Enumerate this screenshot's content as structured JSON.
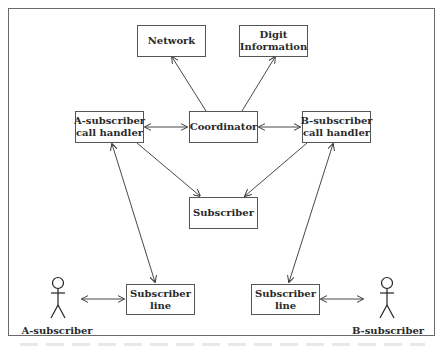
{
  "diagram": {
    "type": "block-diagram",
    "nodes": {
      "network": {
        "lines": [
          "Network"
        ]
      },
      "digit_information": {
        "lines": [
          "Digit",
          "Information"
        ]
      },
      "a_call_handler": {
        "lines": [
          "A-subscriber",
          "call handler"
        ]
      },
      "coordinator": {
        "lines": [
          "Coordinator"
        ]
      },
      "b_call_handler": {
        "lines": [
          "B-subscriber",
          "call handler"
        ]
      },
      "subscriber": {
        "lines": [
          "Subscriber"
        ]
      },
      "a_subscriber_line": {
        "lines": [
          "Subscriber",
          "line"
        ]
      },
      "b_subscriber_line": {
        "lines": [
          "Subscriber",
          "line"
        ]
      }
    },
    "actors": {
      "a_subscriber": {
        "label": "A-subscriber"
      },
      "b_subscriber": {
        "label": "B-subscriber"
      }
    },
    "edges": [
      {
        "from": "coordinator",
        "to": "network",
        "type": "directed"
      },
      {
        "from": "coordinator",
        "to": "digit_information",
        "type": "directed"
      },
      {
        "from": "a_call_handler",
        "to": "coordinator",
        "type": "bidirectional"
      },
      {
        "from": "coordinator",
        "to": "b_call_handler",
        "type": "bidirectional"
      },
      {
        "from": "a_call_handler",
        "to": "subscriber",
        "type": "directed"
      },
      {
        "from": "b_call_handler",
        "to": "subscriber",
        "type": "directed"
      },
      {
        "from": "a_call_handler",
        "to": "a_subscriber_line",
        "type": "bidirectional"
      },
      {
        "from": "b_call_handler",
        "to": "b_subscriber_line",
        "type": "bidirectional"
      },
      {
        "from": "a_subscriber",
        "to": "a_subscriber_line",
        "type": "bidirectional"
      },
      {
        "from": "b_subscriber_line",
        "to": "b_subscriber",
        "type": "bidirectional"
      }
    ],
    "colors": {
      "line": "#333333",
      "box_border": "#555555",
      "frame": "#6a6a6a",
      "text": "#2a2a2a"
    }
  }
}
